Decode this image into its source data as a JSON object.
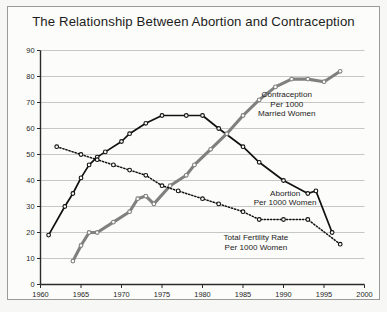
{
  "figure": {
    "title": "The Relationship Between Abortion and Contraception",
    "background_color": "#f7f7f5",
    "frame_color": "#9a9a96"
  },
  "chart_data": {
    "type": "line",
    "title": "The Relationship Between Abortion and Contraception",
    "xlabel": "",
    "ylabel": "",
    "xlim": [
      1960,
      2000
    ],
    "ylim": [
      0,
      90
    ],
    "xticks": [
      1960,
      1965,
      1970,
      1975,
      1980,
      1985,
      1990,
      1995,
      2000
    ],
    "yticks": [
      0,
      10,
      20,
      30,
      40,
      50,
      60,
      70,
      80,
      90
    ],
    "grid": "horizontal",
    "legend_position": "inline-annotations",
    "series": [
      {
        "name": "Abortion Per 1000 Women",
        "style": "solid",
        "color": "#111111",
        "marker": "open-circle",
        "x": [
          1961,
          1963,
          1964,
          1965,
          1966,
          1967,
          1968,
          1970,
          1971,
          1973,
          1975,
          1978,
          1980,
          1982,
          1985,
          1987,
          1990,
          1993,
          1994,
          1996
        ],
        "y": [
          19,
          30,
          35,
          41,
          46,
          49,
          51,
          55,
          58,
          62,
          65,
          65,
          65,
          60,
          53,
          47,
          40,
          35,
          36,
          20
        ]
      },
      {
        "name": "Contraception Per 1000 Married Women",
        "style": "solid",
        "color": "#808080",
        "marker": "open-circle",
        "x": [
          1964,
          1965,
          1966,
          1967,
          1969,
          1971,
          1972,
          1973,
          1974,
          1976,
          1978,
          1979,
          1981,
          1983,
          1985,
          1987,
          1989,
          1991,
          1993,
          1995,
          1997
        ],
        "y": [
          9,
          15,
          20,
          20,
          24,
          28,
          33,
          34,
          31,
          38,
          42,
          46,
          52,
          58,
          65,
          71,
          76,
          79,
          79,
          78,
          82
        ]
      },
      {
        "name": "Total Fertility Rate Per 1000 Women",
        "style": "dotted",
        "color": "#111111",
        "marker": "open-circle",
        "x": [
          1962,
          1965,
          1967,
          1969,
          1971,
          1973,
          1975,
          1977,
          1980,
          1982,
          1985,
          1987,
          1990,
          1993,
          1997
        ],
        "y": [
          53,
          50,
          48,
          46,
          44,
          42,
          38,
          36,
          33,
          31,
          28,
          25,
          25,
          25,
          15.5
        ]
      }
    ],
    "annotations": [
      {
        "name": "contraception-label",
        "lines": [
          "Contraception",
          "Per 1000",
          "Married Women"
        ],
        "x": 1990.4,
        "y": 72
      },
      {
        "name": "abortion-label",
        "lines": [
          "Abortion",
          "Per 1000 Women"
        ],
        "x": 1990.2,
        "y": 34
      },
      {
        "name": "fertility-label",
        "lines": [
          "Total Fertility Rate",
          "Per 1000 Women"
        ],
        "x": 1986.6,
        "y": 17
      }
    ]
  }
}
